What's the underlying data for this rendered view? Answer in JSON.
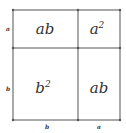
{
  "diagram": {
    "title": "",
    "cells": [
      {
        "id": "top-left",
        "base": "ab",
        "exp": ""
      },
      {
        "id": "top-right",
        "base": "a",
        "exp": "2"
      },
      {
        "id": "bottom-left",
        "base": "b",
        "exp": "2"
      },
      {
        "id": "bottom-right",
        "base": "ab",
        "exp": ""
      }
    ],
    "left_labels": [
      "a",
      "b"
    ],
    "bottom_labels": [
      "b",
      "a"
    ],
    "colors": {
      "line": "#555555",
      "text": "#333333",
      "background": "#ffffff"
    }
  }
}
